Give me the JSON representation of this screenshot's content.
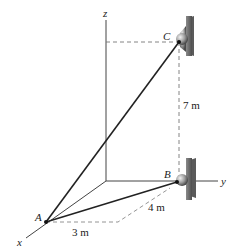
{
  "diagram": {
    "axes": {
      "x": "x",
      "y": "y",
      "z": "z"
    },
    "points": {
      "A": "A",
      "B": "B",
      "C": "C"
    },
    "dimensions": {
      "vertical_BC": "7 m",
      "diagonal_to_B": "4 m",
      "along_x_from_A": "3 m"
    },
    "colors": {
      "line": "#222222",
      "axis": "#444444",
      "dashed": "#777777",
      "support": "#6b6b6b"
    }
  }
}
